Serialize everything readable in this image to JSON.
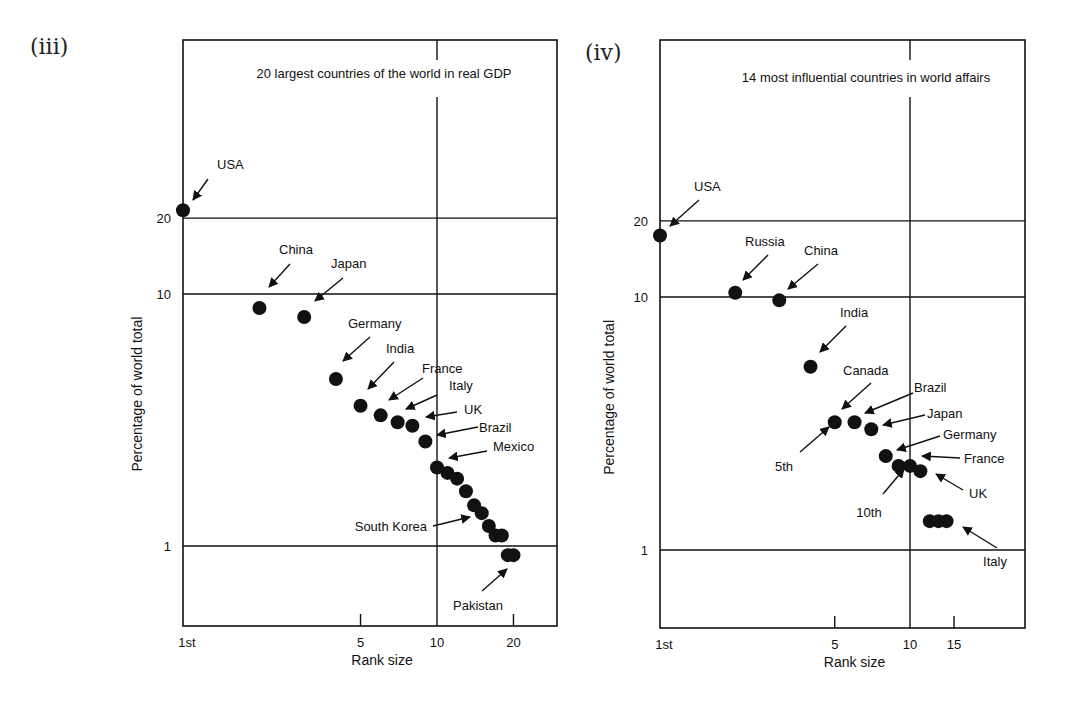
{
  "panels": [
    {
      "label": "(iii)"
    },
    {
      "label": "(iv)"
    }
  ],
  "chart_data": [
    {
      "type": "scatter",
      "panel": "(iii)",
      "title": "20 largest countries of the world in real GDP",
      "xlabel": "Rank size",
      "ylabel": "Percentage of world total",
      "xscale": "log",
      "yscale": "log",
      "x_ticks": [
        "1st",
        "5",
        "10",
        "20"
      ],
      "y_ticks": [
        "20",
        "10",
        "1"
      ],
      "grid": {
        "horizontal": [
          20,
          10,
          1
        ],
        "vertical": [
          10
        ]
      },
      "points": [
        {
          "rank": 1,
          "value": 21.5,
          "label": "USA"
        },
        {
          "rank": 2,
          "value": 8.8,
          "label": "China"
        },
        {
          "rank": 3,
          "value": 8.1,
          "label": "Japan"
        },
        {
          "rank": 4,
          "value": 4.6,
          "label": "Germany"
        },
        {
          "rank": 5,
          "value": 3.6,
          "label": "India"
        },
        {
          "rank": 6,
          "value": 3.3,
          "label": "France"
        },
        {
          "rank": 7,
          "value": 3.1,
          "label": "Italy"
        },
        {
          "rank": 8,
          "value": 3.0,
          "label": "UK"
        },
        {
          "rank": 9,
          "value": 2.6,
          "label": "Brazil"
        },
        {
          "rank": 10,
          "value": 2.05,
          "label": "Mexico"
        },
        {
          "rank": 11,
          "value": 1.95,
          "label": ""
        },
        {
          "rank": 12,
          "value": 1.85,
          "label": ""
        },
        {
          "rank": 13,
          "value": 1.65,
          "label": ""
        },
        {
          "rank": 14,
          "value": 1.45,
          "label": ""
        },
        {
          "rank": 15,
          "value": 1.35,
          "label": "South Korea"
        },
        {
          "rank": 16,
          "value": 1.2,
          "label": ""
        },
        {
          "rank": 17,
          "value": 1.1,
          "label": ""
        },
        {
          "rank": 18,
          "value": 1.1,
          "label": ""
        },
        {
          "rank": 19,
          "value": 0.92,
          "label": ""
        },
        {
          "rank": 20,
          "value": 0.92,
          "label": "Pakistan"
        }
      ]
    },
    {
      "type": "scatter",
      "panel": "(iv)",
      "title": "14 most influential countries in world affairs",
      "xlabel": "Rank size",
      "ylabel": "Percentage of world total",
      "xscale": "log",
      "yscale": "log",
      "x_ticks": [
        "1st",
        "5",
        "10",
        "15"
      ],
      "y_ticks": [
        "20",
        "10",
        "1"
      ],
      "grid": {
        "horizontal": [
          20,
          10,
          1
        ],
        "vertical": [
          10
        ]
      },
      "points": [
        {
          "rank": 1,
          "value": 17.5,
          "label": "USA"
        },
        {
          "rank": 2,
          "value": 10.4,
          "label": "Russia"
        },
        {
          "rank": 3,
          "value": 9.7,
          "label": "China"
        },
        {
          "rank": 4,
          "value": 5.3,
          "label": "India"
        },
        {
          "rank": 5,
          "value": 3.2,
          "label": "Canada"
        },
        {
          "rank": 6,
          "value": 3.2,
          "label": "Brazil"
        },
        {
          "rank": 7,
          "value": 3.0,
          "label": "Japan"
        },
        {
          "rank": 8,
          "value": 2.35,
          "label": "Germany"
        },
        {
          "rank": 9,
          "value": 2.15,
          "label": ""
        },
        {
          "rank": 10,
          "value": 2.15,
          "label": "France"
        },
        {
          "rank": 11,
          "value": 2.05,
          "label": "UK"
        },
        {
          "rank": 12,
          "value": 1.3,
          "label": ""
        },
        {
          "rank": 13,
          "value": 1.3,
          "label": ""
        },
        {
          "rank": 14,
          "value": 1.3,
          "label": "Italy"
        }
      ],
      "annotations": [
        {
          "text": "5th",
          "points_to_rank": 5
        },
        {
          "text": "10th",
          "points_to_rank": 10
        }
      ]
    }
  ]
}
